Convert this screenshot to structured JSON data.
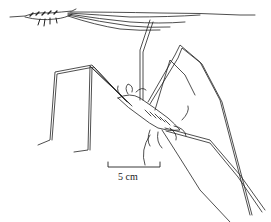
{
  "figure": {
    "subjects": [
      {
        "name": "small-specimen",
        "description": "small shrimp-like arthropod with long trailing antennae"
      },
      {
        "name": "large-specimen",
        "description": "long-legged arthropod drawn in perspective"
      }
    ],
    "scale_bar": {
      "label": "5 cm"
    },
    "colors": {
      "ink": "#222222",
      "background": "#ffffff"
    }
  }
}
